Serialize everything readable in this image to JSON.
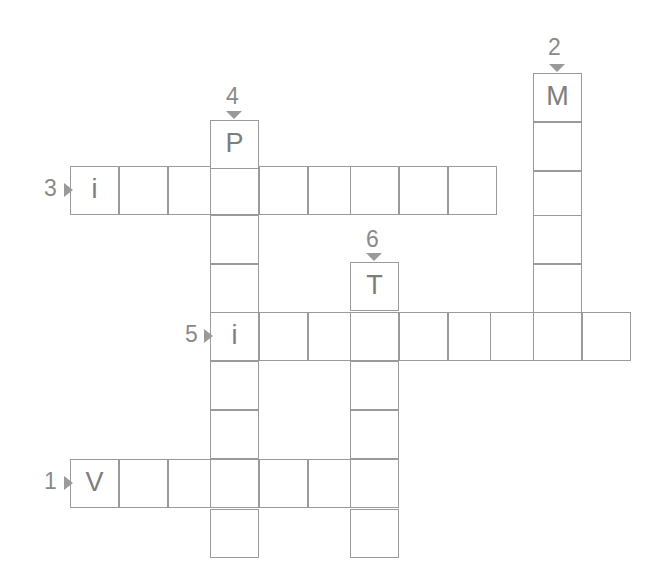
{
  "puzzle": {
    "type": "crossword-grid",
    "width": 661,
    "height": 580,
    "cell_size": 49,
    "grid_color": "#9a9a9a",
    "letter_color": "#7d7d7d",
    "number_color": "#8a8a8a",
    "background": "#ffffff",
    "entries": [
      {
        "number": "1",
        "direction": "across",
        "length": 7,
        "start_letter": "V",
        "marker": "arrow-right"
      },
      {
        "number": "2",
        "direction": "down",
        "length": 6,
        "start_letter": "M",
        "marker": "arrow-down"
      },
      {
        "number": "3",
        "direction": "across",
        "length": 9,
        "start_letter": "i",
        "marker": "arrow-right"
      },
      {
        "number": "4",
        "direction": "down",
        "length": 9,
        "start_letter": "P",
        "marker": "arrow-down"
      },
      {
        "number": "5",
        "direction": "across",
        "length": 9,
        "start_letter": "i",
        "marker": "arrow-right"
      },
      {
        "number": "6",
        "direction": "down",
        "length": 6,
        "start_letter": "T",
        "marker": "arrow-down"
      }
    ],
    "cells": [
      {
        "id": "r3c0",
        "x": 70,
        "y": 166,
        "letter": "i"
      },
      {
        "id": "r3c1",
        "x": 119,
        "y": 166,
        "letter": ""
      },
      {
        "id": "r3c2",
        "x": 168,
        "y": 166,
        "letter": ""
      },
      {
        "id": "r3c3",
        "x": 210,
        "y": 166,
        "letter": ""
      },
      {
        "id": "r3c4",
        "x": 259,
        "y": 166,
        "letter": ""
      },
      {
        "id": "r3c5",
        "x": 308,
        "y": 166,
        "letter": ""
      },
      {
        "id": "r3c6",
        "x": 350,
        "y": 166,
        "letter": ""
      },
      {
        "id": "r3c7",
        "x": 399,
        "y": 166,
        "letter": ""
      },
      {
        "id": "r3c8",
        "x": 448,
        "y": 166,
        "letter": ""
      },
      {
        "id": "r5c0",
        "x": 210,
        "y": 312,
        "letter": "i"
      },
      {
        "id": "r5c1",
        "x": 259,
        "y": 312,
        "letter": ""
      },
      {
        "id": "r5c2",
        "x": 308,
        "y": 312,
        "letter": ""
      },
      {
        "id": "r5c3",
        "x": 350,
        "y": 312,
        "letter": ""
      },
      {
        "id": "r5c4",
        "x": 399,
        "y": 312,
        "letter": ""
      },
      {
        "id": "r5c5",
        "x": 448,
        "y": 312,
        "letter": ""
      },
      {
        "id": "r5c6",
        "x": 490,
        "y": 312,
        "letter": ""
      },
      {
        "id": "r5c7",
        "x": 533,
        "y": 312,
        "letter": ""
      },
      {
        "id": "r5c8",
        "x": 582,
        "y": 312,
        "letter": ""
      },
      {
        "id": "r1c0",
        "x": 70,
        "y": 459,
        "letter": "V"
      },
      {
        "id": "r1c1",
        "x": 119,
        "y": 459,
        "letter": ""
      },
      {
        "id": "r1c2",
        "x": 168,
        "y": 459,
        "letter": ""
      },
      {
        "id": "r1c3",
        "x": 210,
        "y": 459,
        "letter": ""
      },
      {
        "id": "r1c4",
        "x": 259,
        "y": 459,
        "letter": ""
      },
      {
        "id": "r1c5",
        "x": 308,
        "y": 459,
        "letter": ""
      },
      {
        "id": "r1c6",
        "x": 350,
        "y": 459,
        "letter": ""
      },
      {
        "id": "d2r0",
        "x": 533,
        "y": 73,
        "letter": "M"
      },
      {
        "id": "d2r1",
        "x": 533,
        "y": 122,
        "letter": ""
      },
      {
        "id": "d2r2",
        "x": 533,
        "y": 171,
        "letter": ""
      },
      {
        "id": "d2r3",
        "x": 533,
        "y": 215,
        "letter": ""
      },
      {
        "id": "d2r4",
        "x": 533,
        "y": 264,
        "letter": ""
      },
      {
        "id": "d4r0",
        "x": 210,
        "y": 120,
        "letter": "P"
      },
      {
        "id": "d4r1",
        "x": 210,
        "y": 215,
        "letter": ""
      },
      {
        "id": "d4r2",
        "x": 210,
        "y": 264,
        "letter": ""
      },
      {
        "id": "d4r3",
        "x": 210,
        "y": 361,
        "letter": ""
      },
      {
        "id": "d4r4",
        "x": 210,
        "y": 410,
        "letter": ""
      },
      {
        "id": "d4r5",
        "x": 210,
        "y": 509,
        "letter": ""
      },
      {
        "id": "d6r0",
        "x": 350,
        "y": 262,
        "letter": "T"
      },
      {
        "id": "d6r1",
        "x": 350,
        "y": 361,
        "letter": ""
      },
      {
        "id": "d6r2",
        "x": 350,
        "y": 410,
        "letter": ""
      },
      {
        "id": "d6r3",
        "x": 350,
        "y": 509,
        "letter": ""
      }
    ],
    "numbers": [
      {
        "id": "num-1",
        "label": "1",
        "x": 44,
        "y": 470
      },
      {
        "id": "num-2",
        "label": "2",
        "x": 548,
        "y": 36
      },
      {
        "id": "num-3",
        "label": "3",
        "x": 44,
        "y": 177
      },
      {
        "id": "num-4",
        "label": "4",
        "x": 226,
        "y": 85
      },
      {
        "id": "num-5",
        "label": "5",
        "x": 185,
        "y": 323
      },
      {
        "id": "num-6",
        "label": "6",
        "x": 366,
        "y": 228
      }
    ],
    "arrows": [
      {
        "id": "arrow-1",
        "dir": "right",
        "x": 64,
        "y": 476
      },
      {
        "id": "arrow-2",
        "dir": "down",
        "x": 549,
        "y": 64
      },
      {
        "id": "arrow-3",
        "dir": "right",
        "x": 64,
        "y": 183
      },
      {
        "id": "arrow-4",
        "dir": "down",
        "x": 226,
        "y": 111
      },
      {
        "id": "arrow-5",
        "dir": "right",
        "x": 204,
        "y": 329
      },
      {
        "id": "arrow-6",
        "dir": "down",
        "x": 366,
        "y": 253
      }
    ]
  }
}
